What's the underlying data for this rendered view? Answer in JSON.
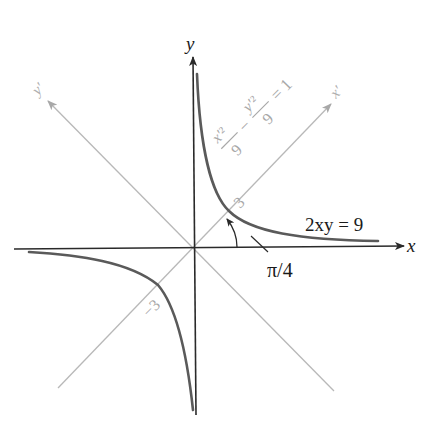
{
  "figure": {
    "colors": {
      "axis": "#2a2a2a",
      "rotated_axis": "#b4b4b4",
      "curve": "#5a5a5a",
      "text": "#1a1a1a",
      "rotated_text": "#a8a8a8",
      "background": "#ffffff"
    },
    "axes": {
      "x_label": "x",
      "y_label": "y",
      "x_prime_label": "x′",
      "y_prime_label": "y′"
    },
    "labels": {
      "curve_equation": "2xy = 9",
      "angle": "π/4",
      "vertex_positive": "3",
      "vertex_negative": "−3",
      "rotated_equation": {
        "term1_num": "x′²",
        "term1_den": "9",
        "minus": "−",
        "term2_num": "y′²",
        "term2_den": "9",
        "equals": "= 1"
      }
    },
    "geometry": {
      "origin_px": [
        194,
        248
      ],
      "rotation_angle_deg": 45,
      "semi_axis_a": 3,
      "hyperbola": "xy = 4.5"
    }
  }
}
